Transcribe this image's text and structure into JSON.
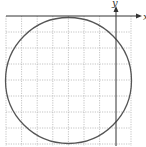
{
  "diagram": {
    "type": "circle-on-grid",
    "axes": {
      "x_label": "x",
      "y_label": "y"
    },
    "grid": {
      "columns": 8,
      "rows": 8,
      "line_style": "dotted",
      "line_color": "#b0b0b0"
    },
    "circle": {
      "stroke_color": "#555555",
      "tangent_to_x_axis": true
    },
    "colors": {
      "axis": "#333333",
      "background": "#ffffff"
    }
  }
}
